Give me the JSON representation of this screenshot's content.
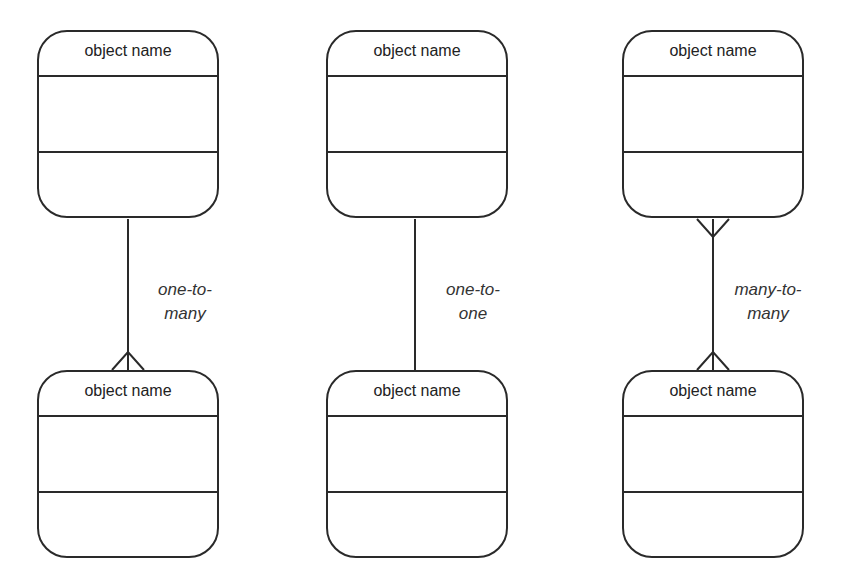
{
  "diagram": {
    "columns": [
      {
        "top": {
          "name": "object name"
        },
        "bottom": {
          "name": "object name"
        },
        "relationship": {
          "line1": "one-to-",
          "line2": "many"
        }
      },
      {
        "top": {
          "name": "object name"
        },
        "bottom": {
          "name": "object name"
        },
        "relationship": {
          "line1": "one-to-",
          "line2": "one"
        }
      },
      {
        "top": {
          "name": "object name"
        },
        "bottom": {
          "name": "object name"
        },
        "relationship": {
          "line1": "many-to-",
          "line2": "many"
        }
      }
    ]
  }
}
